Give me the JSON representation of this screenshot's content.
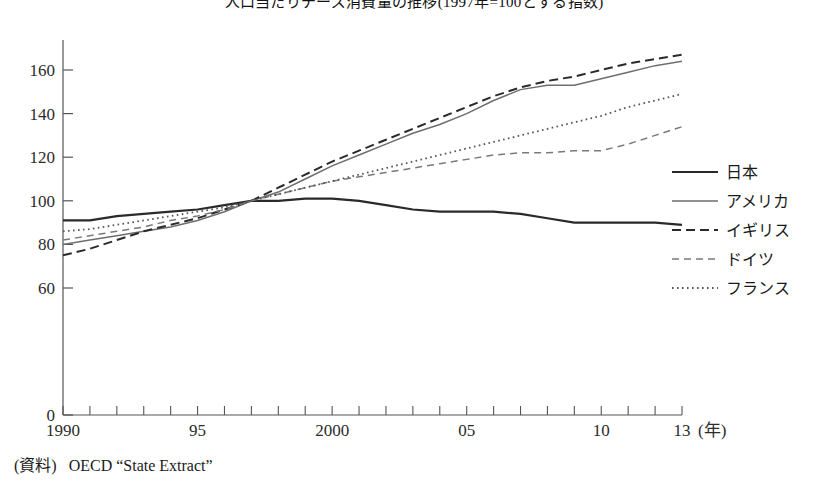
{
  "title": "人口当たりチーズ消費量の推移(1997年=100とする指数)",
  "source": {
    "label": "(資料)",
    "text": "OECD “State Extract”"
  },
  "axes": {
    "y_ticks": [
      "0",
      "60",
      "80",
      "100",
      "120",
      "140",
      "160"
    ],
    "x_ticks": [
      "1990",
      "95",
      "2000",
      "05",
      "10",
      "13"
    ],
    "x_unit": "(年)"
  },
  "legend": {
    "items": [
      {
        "label": "日本",
        "style": "solid-thick",
        "color": "#2a2a2a"
      },
      {
        "label": "アメリカ",
        "style": "solid-thin",
        "color": "#6e6e6e"
      },
      {
        "label": "イギリス",
        "style": "dashed-long",
        "color": "#2a2a2a"
      },
      {
        "label": "ドイツ",
        "style": "dashed-short",
        "color": "#7a7a7a"
      },
      {
        "label": "フランス",
        "style": "dotted",
        "color": "#555555"
      }
    ]
  },
  "chart_data": {
    "type": "line",
    "title": "人口当たりチーズ消費量の推移(1997年=100とする指数)",
    "xlabel": "年",
    "ylabel": "",
    "xlim": [
      1990,
      2013
    ],
    "ylim": [
      0,
      172
    ],
    "y_axis_break": {
      "between": [
        0,
        60
      ],
      "note": "axis broken between 0 and 60"
    },
    "grid": false,
    "legend_position": "right",
    "base_year": 1997,
    "base_value": 100,
    "x": [
      1990,
      1991,
      1992,
      1993,
      1994,
      1995,
      1996,
      1997,
      1998,
      1999,
      2000,
      2001,
      2002,
      2003,
      2004,
      2005,
      2006,
      2007,
      2008,
      2009,
      2010,
      2011,
      2012,
      2013
    ],
    "series": [
      {
        "name": "日本",
        "values": [
          91,
          91,
          93,
          94,
          95,
          96,
          98,
          100,
          100,
          101,
          101,
          100,
          98,
          96,
          95,
          95,
          95,
          94,
          92,
          90,
          90,
          90,
          90,
          89
        ]
      },
      {
        "name": "アメリカ",
        "values": [
          80,
          82,
          84,
          86,
          88,
          91,
          95,
          100,
          104,
          110,
          116,
          121,
          126,
          131,
          135,
          140,
          146,
          151,
          153,
          153,
          156,
          159,
          162,
          164
        ]
      },
      {
        "name": "イギリス",
        "values": [
          75,
          78,
          82,
          86,
          89,
          92,
          96,
          100,
          106,
          112,
          118,
          123,
          128,
          133,
          138,
          143,
          148,
          152,
          155,
          157,
          160,
          163,
          165,
          167
        ]
      },
      {
        "name": "ドイツ",
        "values": [
          82,
          84,
          86,
          88,
          91,
          93,
          96,
          100,
          103,
          106,
          109,
          111,
          113,
          115,
          117,
          119,
          121,
          122,
          122,
          123,
          123,
          126,
          130,
          134
        ]
      },
      {
        "name": "フランス",
        "values": [
          86,
          87,
          89,
          91,
          93,
          95,
          97,
          100,
          103,
          106,
          109,
          112,
          115,
          118,
          121,
          124,
          127,
          130,
          133,
          136,
          139,
          143,
          146,
          149
        ]
      }
    ]
  }
}
